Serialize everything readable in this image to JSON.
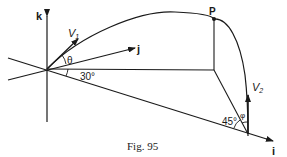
{
  "figure": {
    "caption": "Fig. 95",
    "axes": {
      "k": "k",
      "j": "j",
      "i": "i"
    },
    "labels": {
      "v1": "V",
      "v1_sub": "1",
      "v2": "V",
      "v2_sub": "2",
      "point": "P",
      "theta": "θ",
      "phi": "φ",
      "angle_30": "30°",
      "angle_45": "45°"
    },
    "colors": {
      "ink": "#1a1a1a",
      "background": "#ffffff"
    }
  }
}
